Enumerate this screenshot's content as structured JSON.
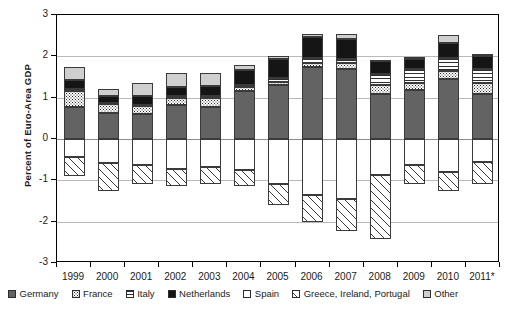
{
  "chart_data": {
    "type": "bar",
    "subtype": "stacked-bar-diverging",
    "title": "",
    "xlabel": "",
    "ylabel": "Percent of Euro-Area GDP",
    "ylim": [
      -3,
      3
    ],
    "yticks": [
      3,
      2,
      1,
      0,
      -1,
      -2,
      -3
    ],
    "ytick_labels": [
      "3",
      "2",
      "1",
      "0",
      "-1",
      "-2",
      "-3"
    ],
    "grid": true,
    "legend_position": "bottom",
    "categories": [
      "1999",
      "2000",
      "2001",
      "2002",
      "2003",
      "2004",
      "2005",
      "2006",
      "2007",
      "2008",
      "2009",
      "2010",
      "2011*"
    ],
    "series": [
      {
        "name": "Germany",
        "pattern": "solid-dark-gray",
        "color": "#636363",
        "values": [
          0.78,
          0.62,
          0.6,
          0.82,
          0.78,
          1.17,
          1.3,
          1.73,
          1.7,
          1.1,
          1.18,
          1.45,
          1.1
        ]
      },
      {
        "name": "France",
        "pattern": "dotted",
        "color": "#ffffff",
        "values": [
          0.38,
          0.22,
          0.2,
          0.18,
          0.2,
          0.1,
          0.08,
          0.1,
          0.13,
          0.2,
          0.18,
          0.2,
          0.25
        ]
      },
      {
        "name": "Italy",
        "pattern": "horizontal-lines",
        "color": "#ffffff",
        "values": [
          0.05,
          0.03,
          0.03,
          0.04,
          0.05,
          0.03,
          0.1,
          0.12,
          0.1,
          0.28,
          0.33,
          0.3,
          0.35
        ]
      },
      {
        "name": "Netherlands",
        "pattern": "solid-black",
        "color": "#151515",
        "values": [
          0.22,
          0.18,
          0.2,
          0.22,
          0.25,
          0.38,
          0.45,
          0.52,
          0.5,
          0.3,
          0.25,
          0.38,
          0.3
        ]
      },
      {
        "name": "Spain",
        "pattern": "white",
        "color": "#ffffff",
        "values": [
          -0.43,
          -0.58,
          -0.62,
          -0.72,
          -0.68,
          -0.75,
          -1.08,
          -1.35,
          -1.45,
          -0.87,
          -0.62,
          -0.8,
          -0.55
        ]
      },
      {
        "name": "Greece, Ireland, Portugal",
        "pattern": "diagonal-hatch",
        "color": "#ffffff",
        "values": [
          -0.46,
          -0.68,
          -0.46,
          -0.42,
          -0.42,
          -0.38,
          -0.52,
          -0.67,
          -0.78,
          -1.55,
          -0.48,
          -0.45,
          -0.55
        ]
      },
      {
        "name": "Other",
        "pattern": "solid-light-gray",
        "color": "#cfcfcf",
        "values": [
          0.3,
          0.17,
          0.33,
          0.33,
          0.32,
          0.12,
          0.07,
          0.07,
          0.12,
          0.02,
          0.04,
          0.18,
          0.05
        ]
      }
    ],
    "totals_positive": [
      1.73,
      1.22,
      1.36,
      1.59,
      1.6,
      1.8,
      2.0,
      2.54,
      2.55,
      1.9,
      1.98,
      2.51,
      2.05
    ],
    "totals_negative": [
      -0.89,
      -1.26,
      -1.08,
      -1.14,
      -1.1,
      -1.13,
      -1.6,
      -2.02,
      -2.23,
      -2.42,
      -1.1,
      -1.25,
      -1.1
    ]
  },
  "axis": {
    "y_title": "Percent of Euro-Area GDP"
  },
  "legend": {
    "items": [
      {
        "label": "Germany",
        "pattern": "p-germany"
      },
      {
        "label": "France",
        "pattern": "p-france"
      },
      {
        "label": "Italy",
        "pattern": "p-italy"
      },
      {
        "label": "Netherlands",
        "pattern": "p-netherlands"
      },
      {
        "label": "Spain",
        "pattern": "p-spain"
      },
      {
        "label": "Greece, Ireland, Portugal",
        "pattern": "p-gip"
      },
      {
        "label": "Other",
        "pattern": "p-other"
      }
    ]
  }
}
